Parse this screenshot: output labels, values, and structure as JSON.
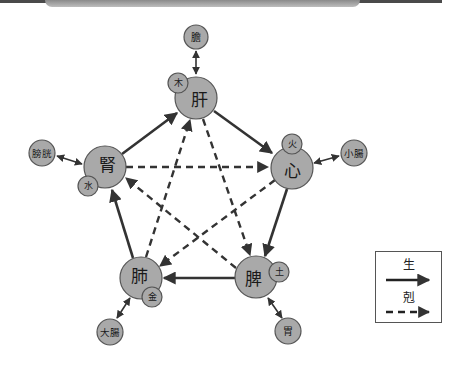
{
  "colors": {
    "node_fill": "#a9a9a9",
    "node_stroke": "#555555",
    "line": "#333333",
    "legend_border": "#555555"
  },
  "organs": {
    "liver": {
      "label": "肝",
      "element": "木",
      "fu": "膽"
    },
    "heart": {
      "label": "心",
      "element": "火",
      "fu": "小腸"
    },
    "spleen": {
      "label": "脾",
      "element": "土",
      "fu": "胃"
    },
    "lung": {
      "label": "肺",
      "element": "金",
      "fu": "大腸"
    },
    "kidney": {
      "label": "腎",
      "element": "水",
      "fu": "膀胱"
    }
  },
  "relations": {
    "generating": [
      "肝→心",
      "心→脾",
      "脾→肺",
      "肺→腎",
      "腎→肝"
    ],
    "controlling": [
      "肝→脾",
      "脾→腎",
      "腎→心",
      "心→肺",
      "肺→肝"
    ]
  },
  "legend": {
    "generating_label": "生",
    "controlling_label": "剋"
  }
}
